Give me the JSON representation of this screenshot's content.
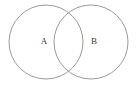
{
  "figure": {
    "kind": "venn-diagram",
    "background_color": "#ffffff",
    "width": 138,
    "height": 86
  },
  "style": {
    "stroke_color": "#9a9a9a",
    "stroke_width": 1,
    "fill": "none",
    "label_color": "#3a3a3a",
    "label_font_size": 9
  },
  "diagram_data": {
    "type": "venn",
    "sets": [
      {
        "id": "set-a",
        "label": "A",
        "center_x": 46,
        "center_y": 42,
        "radius": 37,
        "label_x": 44,
        "label_y": 42
      },
      {
        "id": "set-b",
        "label": "B",
        "center_x": 91,
        "center_y": 42,
        "radius": 37,
        "label_x": 94,
        "label_y": 42
      }
    ],
    "intersection": {
      "label": "",
      "left_x": 54,
      "right_x": 84,
      "top_y": 14,
      "bottom_y": 70
    }
  }
}
